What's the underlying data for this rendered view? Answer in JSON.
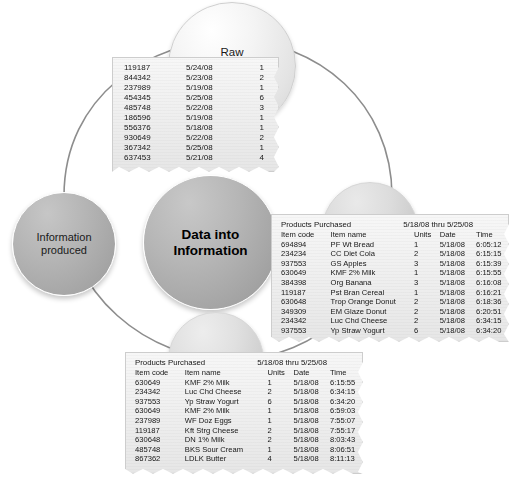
{
  "diagram": {
    "title": "Data into Information",
    "nodes": {
      "raw": "Raw\nnumeric/text\ndata",
      "raw_line1": "Raw",
      "raw_line2": "numeric/text",
      "raw_line3": "data",
      "center_line1": "Data into",
      "center_line2": "Information",
      "processed": "Processed",
      "validated": "Validated",
      "info_line1": "Information",
      "info_line2": "produced"
    },
    "colors": {
      "center_circle": "#a8a8a8",
      "info_circle": "#aeaeae",
      "raw_circle": "#e8e8e8",
      "processed_circle": "#d4d4d4",
      "validated_circle": "#d8d8d8",
      "paper": "#eeeeee",
      "connector_line": "#8d8d8d",
      "text": "#161616"
    }
  },
  "raw_slip": {
    "columns": [
      "Item code",
      "Date",
      "Units"
    ],
    "rows": [
      [
        "119187",
        "5/24/08",
        "1"
      ],
      [
        "844342",
        "5/23/08",
        "2"
      ],
      [
        "237989",
        "5/19/08",
        "1"
      ],
      [
        "454345",
        "5/25/08",
        "6"
      ],
      [
        "485748",
        "5/22/08",
        "3"
      ],
      [
        "186596",
        "5/19/08",
        "1"
      ],
      [
        "556376",
        "5/18/08",
        "1"
      ],
      [
        "930649",
        "5/22/08",
        "2"
      ],
      [
        "367342",
        "5/25/08",
        "1"
      ],
      [
        "637453",
        "5/21/08",
        "4"
      ]
    ]
  },
  "processed_slip": {
    "title": "Products Purchased",
    "date_range": "5/18/08 thru 5/25/08",
    "headers": [
      "Item code",
      "Item name",
      "Units",
      "Date",
      "Time"
    ],
    "rows": [
      [
        "694894",
        "PF Wt Bread",
        "1",
        "5/18/08",
        "6:05:12"
      ],
      [
        "234234",
        "CC Diet Cola",
        "2",
        "5/18/08",
        "6:15:15"
      ],
      [
        "937553",
        "GS Apples",
        "3",
        "5/18/08",
        "6:15:39"
      ],
      [
        "630649",
        "KMF 2% Milk",
        "1",
        "5/18/08",
        "6:15:55"
      ],
      [
        "384398",
        "Org Banana",
        "3",
        "5/18/08",
        "6:16:08"
      ],
      [
        "119187",
        "Pst Bran Cereal",
        "1",
        "5/18/08",
        "6:16:21"
      ],
      [
        "630648",
        "Trop Orange Donut",
        "2",
        "5/18/08",
        "6:18:36"
      ],
      [
        "349309",
        "EM Glaze Donut",
        "2",
        "5/18/08",
        "6:20:51"
      ],
      [
        "234342",
        "Luc Chd Cheese",
        "2",
        "5/18/08",
        "6:34:15"
      ],
      [
        "937553",
        "Yp Straw Yogurt",
        "6",
        "5/18/08",
        "6:34:20"
      ]
    ]
  },
  "validated_slip": {
    "title": "Products Purchased",
    "date_range": "5/18/08 thru 5/25/08",
    "headers": [
      "Item code",
      "Item name",
      "Units",
      "Date",
      "Time"
    ],
    "rows": [
      [
        "630649",
        "KMF 2% Milk",
        "1",
        "5/18/08",
        "6:15:55"
      ],
      [
        "234342",
        "Luc Chd Cheese",
        "2",
        "5/18/08",
        "6:34:15"
      ],
      [
        "937553",
        "Yp Straw Yogurt",
        "6",
        "5/18/08",
        "6:34:20"
      ],
      [
        "630649",
        "KMF 2% Milk",
        "1",
        "5/18/08",
        "6:59:03"
      ],
      [
        "237989",
        "WF Doz Eggs",
        "1",
        "5/18/08",
        "7:55:07"
      ],
      [
        "119187",
        "Kft Strg Cheese",
        "2",
        "5/18/08",
        "7:55:17"
      ],
      [
        "630648",
        "DN 1% Milk",
        "2",
        "5/18/08",
        "8:03:43"
      ],
      [
        "485748",
        "BKS Sour Cream",
        "1",
        "5/18/08",
        "8:06:51"
      ],
      [
        "867362",
        "LDLK Butter",
        "4",
        "5/18/08",
        "8:11:13"
      ]
    ]
  },
  "edge_text": {
    "lines": [
      "T",
      "D",
      "I",
      "T",
      "s",
      "p",
      "t",
      "k",
      "s"
    ]
  }
}
